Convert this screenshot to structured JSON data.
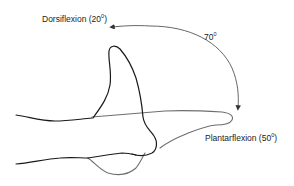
{
  "diagram": {
    "type": "ankle-range-of-motion",
    "labels": {
      "dorsiflexion": {
        "text": "Dorsiflexion (20",
        "degree_symbol": "0",
        "close": ")"
      },
      "total_arc": {
        "text": "70",
        "degree_symbol": "0"
      },
      "plantarflexion": {
        "text": "Plantarflexion (50",
        "degree_symbol": "0",
        "close": ")"
      }
    },
    "colors": {
      "dorsiflexed_foot": "#1a1a1a",
      "plantarflexed_foot": "#6e6e6e",
      "arc": "#555555",
      "text": "#222222"
    }
  }
}
